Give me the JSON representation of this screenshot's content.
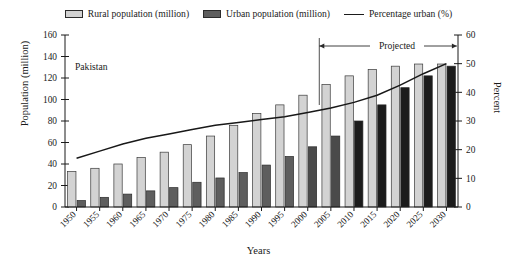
{
  "legend": {
    "items": [
      {
        "label": "Rural population (million)",
        "swatch": "rural-swatch-icon",
        "color": "#d3d3d3"
      },
      {
        "label": "Urban population (million)",
        "swatch": "urban-swatch-icon",
        "color": "#5e5e5e"
      },
      {
        "label": "Percentage urban (%)",
        "swatch": "line-swatch-icon",
        "color": "#181818"
      }
    ]
  },
  "annotations": {
    "country": "Pakistan",
    "projected": "Projected"
  },
  "axes": {
    "left_title": "Population (million)",
    "right_title": "Percent",
    "x_title": "Years"
  },
  "chart_data": {
    "type": "bar",
    "title": "",
    "subtitle": "",
    "annotation_country": "Pakistan",
    "annotation_projected": "Projected",
    "projected_start_category": "2005",
    "projected_end_category": "2030",
    "xlabel": "Years",
    "ylabel": "Population (million)",
    "y2label": "Percent",
    "ylim": [
      0,
      160
    ],
    "y2lim": [
      0,
      60
    ],
    "yticks": [
      0,
      20,
      40,
      60,
      80,
      100,
      120,
      140,
      160
    ],
    "y2ticks": [
      0,
      10,
      20,
      30,
      40,
      50,
      60
    ],
    "grid": false,
    "legend_position": "top",
    "categories": [
      "1950",
      "1955",
      "1960",
      "1965",
      "1970",
      "1975",
      "1980",
      "1985",
      "1990",
      "1995",
      "2000",
      "2005",
      "2010",
      "2015",
      "2020",
      "2025",
      "2030"
    ],
    "series": [
      {
        "name": "Rural population (million)",
        "type": "bar",
        "axis": "left",
        "color": "#d3d3d3",
        "values": [
          33,
          36,
          40,
          46,
          51,
          58,
          66,
          76,
          87,
          95,
          104,
          114,
          122,
          128,
          131,
          133,
          133
        ]
      },
      {
        "name": "Urban population (million)",
        "type": "bar",
        "axis": "left",
        "color": "#5e5e5e",
        "values": [
          6,
          9,
          12,
          15,
          18,
          23,
          27,
          32,
          39,
          47,
          56,
          66,
          80,
          95,
          111,
          122,
          131
        ]
      },
      {
        "name": "Percentage urban (%)",
        "type": "line",
        "axis": "right",
        "color": "#181818",
        "values": [
          17.0,
          19.5,
          22.0,
          24.0,
          25.5,
          27.0,
          28.5,
          29.5,
          30.5,
          31.5,
          33.0,
          34.5,
          36.5,
          39.0,
          42.5,
          46.5,
          50.0
        ]
      }
    ]
  }
}
